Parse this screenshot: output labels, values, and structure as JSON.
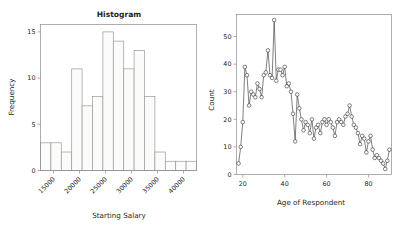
{
  "figure": {
    "background_color": "#ffffff",
    "panel_count": 2
  },
  "chart_data": [
    {
      "id": "histogram",
      "type": "bar",
      "title": "Histogram",
      "xlabel": "Starting Salary",
      "ylabel": "Frequency",
      "grid": false,
      "legend": "none",
      "xlim": [
        12500,
        42500
      ],
      "ylim": [
        0,
        15.8
      ],
      "bin_width": 2000,
      "xticks": [
        15000,
        20000,
        25000,
        30000,
        35000,
        40000
      ],
      "xtick_labels": [
        "15000",
        "20000",
        "25000",
        "30000",
        "35000",
        "40000"
      ],
      "xtick_label_rotation": -45,
      "yticks": [
        0,
        5,
        10,
        15
      ],
      "ytick_labels": [
        "0",
        "5",
        "10",
        "15"
      ],
      "bin_edges": [
        12500,
        14500,
        16500,
        18500,
        20500,
        22500,
        24500,
        26500,
        28500,
        30500,
        32500,
        34500,
        36500,
        38500,
        40500,
        42500
      ],
      "categories": [
        "12500-14500",
        "14500-16500",
        "16500-18500",
        "18500-20500",
        "20500-22500",
        "22500-24500",
        "24500-26500",
        "26500-28500",
        "28500-30500",
        "30500-32500",
        "32500-34500",
        "34500-36500",
        "36500-38500",
        "38500-40500",
        "40500-42500"
      ],
      "values": [
        3,
        3,
        2,
        11,
        7,
        8,
        15,
        14,
        11,
        13,
        8,
        2,
        1,
        1,
        1
      ],
      "bar_fill_color": "#fbfbfa",
      "bar_edge_color": "#9a9a9a"
    },
    {
      "id": "age-count-line",
      "type": "line",
      "title": "",
      "xlabel": "Age of Respondent",
      "ylabel": "Count",
      "grid": false,
      "legend": "none",
      "markers": "open-circle",
      "xlim": [
        17,
        91
      ],
      "ylim": [
        0,
        58
      ],
      "xticks": [
        20,
        40,
        60,
        80
      ],
      "xtick_labels": [
        "20",
        "40",
        "60",
        "80"
      ],
      "yticks": [
        0,
        10,
        20,
        30,
        40,
        50
      ],
      "ytick_labels": [
        "0",
        "10",
        "20",
        "30",
        "40",
        "50"
      ],
      "line_color": "#3a3a3a",
      "marker_face_color": "#ffffff",
      "marker_edge_color": "#2f2f2f",
      "x": [
        18,
        19,
        20,
        21,
        22,
        23,
        24,
        25,
        26,
        27,
        28,
        29,
        30,
        31,
        32,
        33,
        34,
        35,
        36,
        37,
        38,
        39,
        40,
        41,
        42,
        43,
        44,
        45,
        46,
        47,
        48,
        49,
        50,
        51,
        52,
        53,
        54,
        55,
        56,
        57,
        58,
        59,
        60,
        61,
        62,
        63,
        64,
        65,
        66,
        67,
        68,
        69,
        70,
        71,
        72,
        73,
        74,
        75,
        76,
        77,
        78,
        79,
        80,
        81,
        82,
        83,
        84,
        85,
        86,
        87,
        88,
        89,
        90
      ],
      "y": [
        4,
        10,
        19,
        39,
        36,
        25,
        30,
        29,
        28,
        33,
        31,
        28,
        36,
        37,
        45,
        36,
        35,
        56,
        34,
        38,
        38,
        36,
        39,
        32,
        33,
        30,
        22,
        12,
        29,
        24,
        20,
        16,
        19,
        18,
        15,
        20,
        13,
        17,
        18,
        15,
        19,
        20,
        18,
        20,
        19,
        17,
        14,
        19,
        20,
        19,
        18,
        21,
        22,
        25,
        21,
        18,
        17,
        15,
        11,
        14,
        13,
        8,
        12,
        14,
        9,
        6,
        7,
        6,
        5,
        4,
        2,
        5,
        9
      ]
    }
  ]
}
